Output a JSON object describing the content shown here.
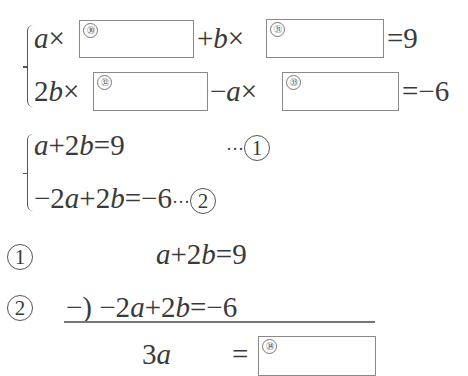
{
  "system1": {
    "eq1": {
      "var_a": "a",
      "times1": "×",
      "box_label_30": "㉚",
      "plus_b": "+",
      "var_b": "b",
      "times2": "×",
      "box_label_31": "㉛",
      "rhs": "=9"
    },
    "eq2": {
      "coef_2b": "2",
      "var_b": "b",
      "times1": "×",
      "box_label_32": "㉜",
      "minus": "−",
      "var_a": "a",
      "times2": "×",
      "box_label_33": "㉝",
      "rhs": "=−6"
    }
  },
  "system2": {
    "eq1": {
      "lhs_a": "a",
      "rest": "+2",
      "var_b": "b",
      "rhs": "=9",
      "dots": "···",
      "label": "1"
    },
    "eq2": {
      "neg2": "−2",
      "var_a": "a",
      "plus2": "+2",
      "var_b": "b",
      "rhs": "=−6",
      "dots": "···",
      "label": "2"
    }
  },
  "subtraction": {
    "row1": {
      "label": "1",
      "var_a": "a",
      "mid": "+2",
      "var_b": "b",
      "rhs": "=9"
    },
    "row2": {
      "label": "2",
      "op": "−)",
      "neg2": "−2",
      "var_a": "a",
      "mid": "+2",
      "var_b": "b",
      "rhs": "=−6"
    },
    "result": {
      "coef": "3",
      "var_a": "a",
      "eq": "=",
      "box_label_34": "㉞"
    }
  }
}
